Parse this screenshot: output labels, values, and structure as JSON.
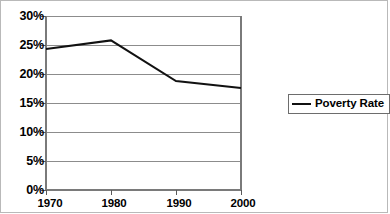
{
  "chart_data": {
    "type": "line",
    "title": "",
    "xlabel": "",
    "ylabel": "",
    "x": [
      1970,
      1980,
      1990,
      2000
    ],
    "categories": [
      "1970",
      "1980",
      "1990",
      "2000"
    ],
    "series": [
      {
        "name": "Poverty Rate",
        "values": [
          24.3,
          25.8,
          18.8,
          17.6
        ]
      }
    ],
    "ylim": [
      0,
      30
    ],
    "ytick_values": [
      0,
      5,
      10,
      15,
      20,
      25,
      30
    ],
    "ytick_labels": [
      "0%",
      "5%",
      "10%",
      "15%",
      "20%",
      "25%",
      "30%"
    ],
    "xtick_labels": [
      "1970",
      "1980",
      "1990",
      "2000"
    ],
    "grid": "horizontal",
    "legend_position": "right",
    "legend_entries": [
      "Poverty Rate"
    ],
    "colors": {
      "line": "#111111",
      "grid": "#8c8c8c",
      "axis": "#7a7a7a",
      "frame": "#b9b9b9",
      "legend_border": "#6d6d6d",
      "background": "#ffffff",
      "text": "#000000"
    }
  },
  "legend": {
    "label": "Poverty Rate",
    "swatch": "line-swatch"
  }
}
